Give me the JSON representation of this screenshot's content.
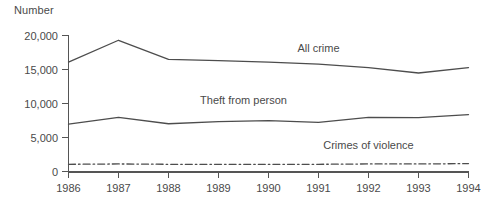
{
  "chart_data": {
    "type": "line",
    "title": "",
    "subtitle": "",
    "ylabel": "Number",
    "xlabel": "",
    "x": [
      1986,
      1987,
      1988,
      1989,
      1990,
      1991,
      1992,
      1993,
      1994
    ],
    "categories": [
      "1986",
      "1987",
      "1988",
      "1989",
      "1990",
      "1991",
      "1992",
      "1993",
      "1994"
    ],
    "xlim": [
      1986,
      1994
    ],
    "ylim": [
      0,
      20000
    ],
    "yticks": [
      0,
      5000,
      10000,
      15000,
      20000
    ],
    "ytick_labels": [
      "0",
      "5,000",
      "10,000",
      "15,000",
      "20,000"
    ],
    "xtick_labels": [
      "1986",
      "1987",
      "1988",
      "1989",
      "1990",
      "1991",
      "1992",
      "1993",
      "1994"
    ],
    "grid": false,
    "legend_position": "inline-labels",
    "series": [
      {
        "name": "All crime",
        "style": "solid",
        "color": "#4d4d4d",
        "values": [
          16100,
          19300,
          16500,
          16300,
          16100,
          15800,
          15300,
          14500,
          15300
        ],
        "label_x": 1991.0,
        "label_y": 17600
      },
      {
        "name": "Theft from person",
        "style": "solid",
        "color": "#4d4d4d",
        "values": [
          7000,
          8000,
          7050,
          7350,
          7500,
          7250,
          8000,
          7950,
          8400
        ],
        "label_x": 1989.5,
        "label_y": 9900
      },
      {
        "name": "Crimes of violence",
        "style": "dash-dot",
        "color": "#4d4d4d",
        "values": [
          1100,
          1150,
          1100,
          1100,
          1100,
          1100,
          1150,
          1150,
          1200
        ],
        "label_x": 1992.0,
        "label_y": 3300
      }
    ]
  },
  "axis": {
    "y_title": "Number"
  }
}
